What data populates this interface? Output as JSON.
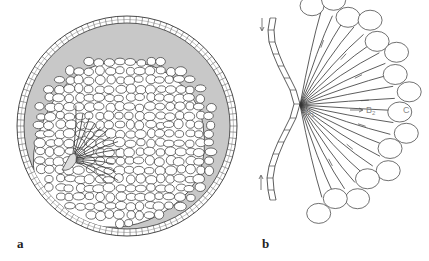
{
  "figure": {
    "panels": [
      {
        "id": "a",
        "label": "a",
        "description": "Cross-section of a spherical embryo: outer layer of small cuboidal cells enclosing a grey cavity, with a large mass of rounded cells and elongated cells converging at a groove on the left"
      },
      {
        "id": "b",
        "label": "b",
        "description": "Detail of cell migration from a central indentation; arrows indicate direction of movement",
        "annotations": {
          "b1": "B",
          "b1_sub": "1",
          "b2": "B",
          "b2_sub": "2",
          "c": "C"
        }
      }
    ],
    "colors": {
      "cavity": "#c8c8c8",
      "line": "#333333",
      "annotation": "#888888",
      "background": "#ffffff"
    }
  }
}
